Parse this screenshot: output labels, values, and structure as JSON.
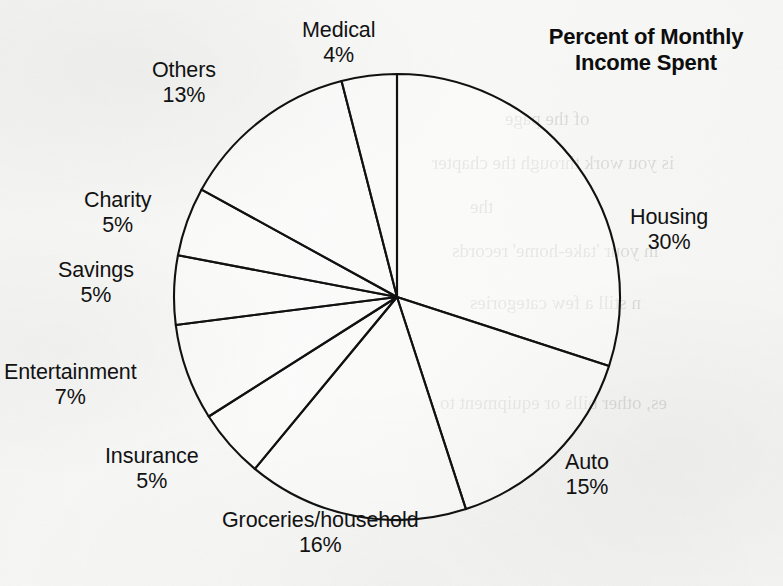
{
  "chart_title": {
    "line1": "Percent of Monthly",
    "line2": "Income Spent",
    "full": "Percent of Monthly Income Spent"
  },
  "chart_data": {
    "type": "pie",
    "title": "Percent of Monthly Income Spent",
    "xlabel": "",
    "ylabel": "",
    "units": "percent",
    "total": 100,
    "start_angle_deg": 0,
    "direction": "clockwise",
    "legend": "none",
    "grid": false,
    "slice_fill": "#ffffff",
    "slice_stroke": "#111111",
    "categories": [
      "Housing",
      "Auto",
      "Groceries/household",
      "Insurance",
      "Entertainment",
      "Savings",
      "Charity",
      "Others",
      "Medical"
    ],
    "values": [
      30,
      15,
      16,
      5,
      7,
      5,
      5,
      13,
      4
    ],
    "slices": [
      {
        "label": "Housing",
        "value": 30,
        "pct_text": "30%",
        "label_x": 630,
        "label_y": 205
      },
      {
        "label": "Auto",
        "value": 15,
        "pct_text": "15%",
        "label_x": 565,
        "label_y": 450
      },
      {
        "label": "Groceries/household",
        "value": 16,
        "pct_text": "16%",
        "label_x": 222,
        "label_y": 508
      },
      {
        "label": "Insurance",
        "value": 5,
        "pct_text": "5%",
        "label_x": 105,
        "label_y": 444
      },
      {
        "label": "Entertainment",
        "value": 7,
        "pct_text": "7%",
        "label_x": 4,
        "label_y": 360
      },
      {
        "label": "Savings",
        "value": 5,
        "pct_text": "5%",
        "label_x": 58,
        "label_y": 258
      },
      {
        "label": "Charity",
        "value": 5,
        "pct_text": "5%",
        "label_x": 84,
        "label_y": 188
      },
      {
        "label": "Others",
        "value": 13,
        "pct_text": "13%",
        "label_x": 152,
        "label_y": 58
      },
      {
        "label": "Medical",
        "value": 4,
        "pct_text": "4%",
        "label_x": 302,
        "label_y": 18
      }
    ]
  },
  "ghost_text": {
    "lines": [
      "of the page",
      "is you work through the chapter",
      "the",
      "in your 'take-home' records",
      "n still a few categories",
      "es, other bills or equipment to"
    ]
  }
}
